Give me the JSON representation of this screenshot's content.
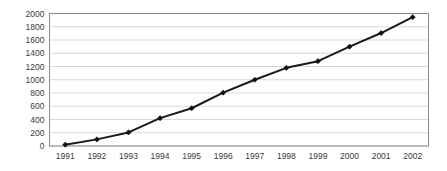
{
  "chart_data": {
    "type": "line",
    "title": "",
    "subtitle": "",
    "xlabel": "",
    "ylabel": "",
    "categories": [
      "1991",
      "1992",
      "1993",
      "1994",
      "1995",
      "1996",
      "1997",
      "1998",
      "1999",
      "2000",
      "2001",
      "2002"
    ],
    "values": [
      20,
      100,
      205,
      420,
      570,
      805,
      1000,
      1180,
      1280,
      1500,
      1705,
      1945
    ],
    "series": [
      {
        "name": "",
        "values": [
          20,
          100,
          205,
          420,
          570,
          805,
          1000,
          1180,
          1280,
          1500,
          1705,
          1945
        ]
      }
    ],
    "ylim": [
      0,
      2000
    ],
    "ytick_labels": [
      "0",
      "200",
      "400",
      "600",
      "800",
      "1000",
      "1200",
      "1400",
      "1600",
      "1800",
      "2000"
    ],
    "ytick_values": [
      0,
      200,
      400,
      600,
      800,
      1000,
      1200,
      1400,
      1600,
      1800,
      2000
    ],
    "xtick_labels": [
      "1991",
      "1992",
      "1993",
      "1994",
      "1995",
      "1996",
      "1997",
      "1998",
      "1999",
      "2000",
      "2001",
      "2002"
    ],
    "grid": true,
    "grid_axis": "y",
    "legend": false,
    "legend_position": "none",
    "marker": "diamond",
    "colors": {
      "line": "#1a1a1a",
      "marker": "#111111",
      "grid": "#c8c8c8",
      "axis": "#8a8a8a",
      "tick_text": "#3a3a3a",
      "background": "#ffffff"
    }
  }
}
